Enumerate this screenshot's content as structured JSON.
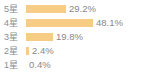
{
  "chart_data": {
    "type": "bar",
    "orientation": "horizontal",
    "title": "",
    "xlabel": "",
    "ylabel": "",
    "categories": [
      "5星",
      "4星",
      "3星",
      "2星",
      "1星"
    ],
    "values": [
      29.2,
      48.1,
      19.8,
      2.4,
      0.4
    ],
    "value_labels": [
      "29.2%",
      "48.1%",
      "19.8%",
      "2.4%",
      "0.4%"
    ],
    "units": "%",
    "xlim": [
      0,
      100
    ],
    "grid": false,
    "legend": null,
    "bar_color": "#f7cc84",
    "label_color": "#8c8c8c",
    "value_color": "#888888",
    "background_color": "#ffffff",
    "max_bar_width_px": 80
  },
  "rows": [
    {
      "label": "5星",
      "value": "29.2%",
      "bar_px": 40
    },
    {
      "label": "4星",
      "value": "48.1%",
      "bar_px": 67
    },
    {
      "label": "3星",
      "value": "19.8%",
      "bar_px": 27
    },
    {
      "label": "2星",
      "value": "2.4%",
      "bar_px": 3
    },
    {
      "label": "1星",
      "value": "0.4%",
      "bar_px": 0
    }
  ]
}
